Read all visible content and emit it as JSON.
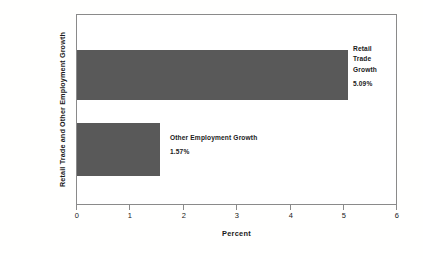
{
  "chart_data": {
    "type": "bar",
    "orientation": "horizontal",
    "title": "",
    "xlabel": "Percent",
    "ylabel": "Retail Trade and Other Employment Growth",
    "categories": [
      "Retail Trade Growth",
      "Other Employment Growth"
    ],
    "values": [
      5.09,
      1.57
    ],
    "value_labels": [
      "5.09%",
      "1.57%"
    ],
    "xlim": [
      0,
      6
    ],
    "xticks": [
      0,
      1,
      2,
      3,
      4,
      5,
      6
    ],
    "xtick_labels": [
      "0",
      "1",
      "2",
      "3",
      "4",
      "5",
      "6"
    ],
    "grid": false,
    "legend": "none",
    "bar_color": "#595959",
    "frame_color": "#8a8a8a",
    "background": "#ffffff",
    "series": [
      {
        "name": "Growth",
        "values": [
          5.09,
          1.57
        ]
      }
    ],
    "annotations": [
      {
        "target": "Retail Trade Growth",
        "label_lines": [
          "Retail",
          "Trade",
          "Growth"
        ],
        "value_label": "5.09%"
      },
      {
        "target": "Other Employment Growth",
        "label_lines": [
          "Other Employment Growth"
        ],
        "value_label": "1.57%"
      }
    ]
  },
  "axes": {
    "x_title": "Percent",
    "y_title": "Retail Trade and Other Employment Growth",
    "x_tick_0": "0",
    "x_tick_1": "1",
    "x_tick_2": "2",
    "x_tick_3": "3",
    "x_tick_4": "4",
    "x_tick_5": "5",
    "x_tick_6": "6"
  },
  "labels": {
    "retail_line_1": "Retail",
    "retail_line_2": "Trade",
    "retail_line_3": "Growth",
    "retail_value": "5.09%",
    "other_line_1": "Other Employment Growth",
    "other_value": "1.57%"
  }
}
